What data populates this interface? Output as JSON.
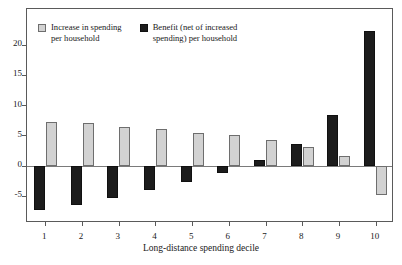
{
  "chart_data": {
    "type": "bar",
    "title": "",
    "xlabel": "Long-distance spending decile",
    "ylabel": "",
    "categories": [
      "1",
      "2",
      "3",
      "4",
      "5",
      "6",
      "7",
      "8",
      "9",
      "10"
    ],
    "yticks": [
      -5,
      0,
      5,
      10,
      15,
      20
    ],
    "ytick_labels": [
      "-5",
      "0",
      "5",
      "10",
      "15",
      "20"
    ],
    "ylim": [
      -9.5,
      25.9
    ],
    "grid": false,
    "legend_position": "top-left-inside",
    "series": [
      {
        "name": "Benefit (net of increased\nspending) per household",
        "color": "#1c1c1c",
        "values": [
          -7.4,
          -6.5,
          -5.3,
          -4.1,
          -2.7,
          -1.2,
          0.9,
          3.6,
          8.3,
          22.3
        ]
      },
      {
        "name": "Increase in spending\nper household",
        "color": "#d2d2d2",
        "values": [
          7.2,
          7.0,
          6.4,
          6.0,
          5.4,
          5.0,
          4.2,
          3.0,
          1.6,
          -4.8
        ]
      }
    ]
  },
  "legend": {
    "items": [
      {
        "label": "Increase in spending\nper household",
        "swatch": "light"
      },
      {
        "label": "Benefit (net of increased\nspending) per household",
        "swatch": "dark"
      }
    ]
  },
  "axes": {
    "x_title": "Long-distance spending decile"
  }
}
